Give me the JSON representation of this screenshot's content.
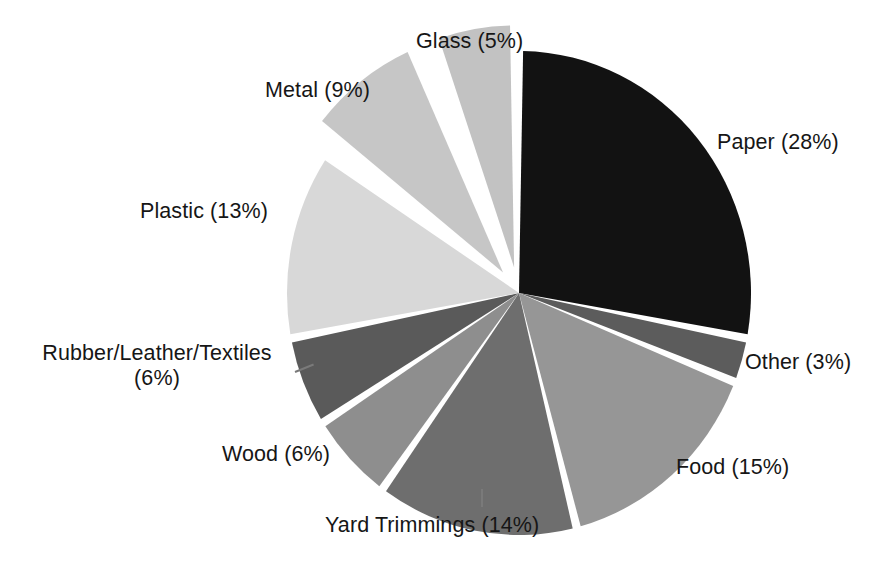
{
  "figure": {
    "background_color": "#ffffff",
    "text_color": "#161616"
  },
  "chart_data": {
    "type": "pie",
    "title": "",
    "subtitle": "",
    "xlabel": "",
    "ylabel": "",
    "legend_position": "none",
    "grid": false,
    "label_format": "{name} ({value}%)",
    "total": 99,
    "units": "percent",
    "categories": [
      "Paper",
      "Other",
      "Food",
      "Yard Trimmings",
      "Wood",
      "Rubber/Leather/Textiles",
      "Plastic",
      "Metal",
      "Glass"
    ],
    "values": [
      28,
      3,
      15,
      14,
      6,
      6,
      13,
      9,
      5
    ],
    "colors": [
      "#121212",
      "#5c5c5c",
      "#969696",
      "#6e6e6e",
      "#8e8e8e",
      "#5a5a5a",
      "#d8d8d8",
      "#c6c6c6",
      "#c2c2c2"
    ],
    "slices": [
      {
        "name": "Paper",
        "value": 28,
        "label": "Paper (28%)",
        "color": "#121212",
        "start_angle": 0,
        "end_angle": 100.8,
        "exploded": false
      },
      {
        "name": "Other",
        "value": 3,
        "label": "Other (3%)",
        "color": "#5c5c5c",
        "start_angle": 100.8,
        "end_angle": 111.6,
        "exploded": false
      },
      {
        "name": "Food",
        "value": 15,
        "label": "Food (15%)",
        "color": "#969696",
        "start_angle": 111.6,
        "end_angle": 165.6,
        "exploded": false
      },
      {
        "name": "Yard Trimmings",
        "value": 14,
        "label": "Yard Trimmings (14%)",
        "color": "#6e6e6e",
        "start_angle": 165.6,
        "end_angle": 216.0,
        "exploded": false
      },
      {
        "name": "Wood",
        "value": 6,
        "label": "Wood (6%)",
        "color": "#8e8e8e",
        "start_angle": 216.0,
        "end_angle": 237.6,
        "exploded": false
      },
      {
        "name": "Rubber/Leather/Textiles",
        "value": 6,
        "label": "Rubber/Leather/Textiles",
        "label_line2": "(6%)",
        "color": "#5a5a5a",
        "start_angle": 237.6,
        "end_angle": 259.2,
        "exploded": false
      },
      {
        "name": "Plastic",
        "value": 13,
        "label": "Plastic (13%)",
        "color": "#d8d8d8",
        "start_angle": 259.2,
        "end_angle": 306.0,
        "exploded": false
      },
      {
        "name": "Metal",
        "value": 9,
        "label": "Metal (9%)",
        "color": "#c6c6c6",
        "start_angle": 306.0,
        "end_angle": 338.4,
        "exploded": true
      },
      {
        "name": "Glass",
        "value": 5,
        "label": "Glass (5%)",
        "color": "#c2c2c2",
        "start_angle": 338.4,
        "end_angle": 360.0,
        "exploded": true
      }
    ]
  },
  "labels": {
    "glass": "Glass (5%)",
    "metal": "Metal (9%)",
    "paper": "Paper (28%)",
    "plastic": "Plastic (13%)",
    "rubber_line1": "Rubber/Leather/Textiles",
    "rubber_line2": "(6%)",
    "wood": "Wood (6%)",
    "yard_trimmings": "Yard Trimmings (14%)",
    "food": "Food (15%)",
    "other": "Other (3%)"
  }
}
